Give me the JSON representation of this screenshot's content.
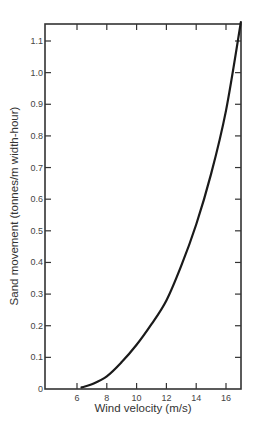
{
  "chart_data": {
    "type": "line",
    "title": "",
    "xlabel": "Wind velocity (m/s)",
    "ylabel": "Sand movement (tonnes/m width-hour)",
    "xlim": [
      4,
      17
    ],
    "ylim": [
      0,
      1.16
    ],
    "x_ticks": [
      6,
      8,
      10,
      12,
      14,
      16
    ],
    "x_tick_labels": [
      "6",
      "8",
      "10",
      "12",
      "14",
      "16"
    ],
    "y_ticks": [
      0,
      0.1,
      0.2,
      0.3,
      0.4,
      0.5,
      0.6,
      0.7,
      0.8,
      0.9,
      1.0,
      1.1
    ],
    "y_tick_labels": [
      "0",
      "0.1",
      "0.2",
      "0.3",
      "0.4",
      "0.5",
      "0.6",
      "0.7",
      "0.8",
      "0.9",
      "1.0",
      "1.1"
    ],
    "grid": false,
    "legend": null,
    "series": [
      {
        "name": "Sand movement",
        "color": "#1a1a1a",
        "x": [
          6.3,
          7,
          8,
          9,
          10,
          11,
          12,
          13,
          14,
          15,
          16,
          17
        ],
        "values": [
          0.005,
          0.015,
          0.04,
          0.085,
          0.14,
          0.205,
          0.28,
          0.39,
          0.52,
          0.68,
          0.88,
          1.16
        ]
      }
    ]
  }
}
